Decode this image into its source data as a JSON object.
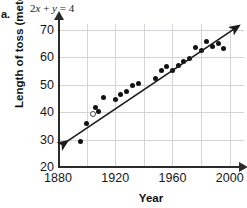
{
  "problem": {
    "letter": "a.",
    "equation": "2x + y = 4",
    "equation_lhs_coeff": "2",
    "equation_var_x": "x",
    "equation_plus": "+",
    "equation_var_y": "y",
    "equation_equals": "=",
    "equation_rhs": "4"
  },
  "chart_data": {
    "type": "scatter",
    "title": "",
    "xlabel": "Year",
    "ylabel": "Length of toss (meters)",
    "xlim": [
      1880,
      2010
    ],
    "ylim": [
      20,
      72
    ],
    "xticks": [
      1880,
      1920,
      1960,
      2000
    ],
    "xtick_labels": [
      "1880",
      "1920",
      "1960",
      "2000"
    ],
    "yticks": [
      20,
      30,
      40,
      50,
      60,
      70
    ],
    "ytick_labels": [
      "20",
      "30",
      "40",
      "50",
      "60",
      "70"
    ],
    "x_gridlines": [
      1900,
      1920,
      1940,
      1960,
      1980,
      2000
    ],
    "y_gridlines": [
      30,
      40,
      50,
      60,
      70
    ],
    "grid": true,
    "legend": "none",
    "series": [
      {
        "name": "Length of toss",
        "marker": "filled-circle",
        "points": [
          {
            "x": 1896,
            "y": 29.2,
            "style": "filled"
          },
          {
            "x": 1900,
            "y": 36.0,
            "style": "filled"
          },
          {
            "x": 1904,
            "y": 39.3,
            "style": "open"
          },
          {
            "x": 1906,
            "y": 41.5,
            "style": "filled"
          },
          {
            "x": 1908,
            "y": 40.2,
            "style": "filled"
          },
          {
            "x": 1912,
            "y": 45.2,
            "style": "filled"
          },
          {
            "x": 1920,
            "y": 44.7,
            "style": "filled"
          },
          {
            "x": 1924,
            "y": 46.2,
            "style": "filled"
          },
          {
            "x": 1928,
            "y": 47.3,
            "style": "filled"
          },
          {
            "x": 1932,
            "y": 49.5,
            "style": "filled"
          },
          {
            "x": 1936,
            "y": 50.5,
            "style": "filled"
          },
          {
            "x": 1948,
            "y": 52.1,
            "style": "filled"
          },
          {
            "x": 1952,
            "y": 55.0,
            "style": "filled"
          },
          {
            "x": 1956,
            "y": 56.4,
            "style": "filled"
          },
          {
            "x": 1960,
            "y": 55.1,
            "style": "filled"
          },
          {
            "x": 1964,
            "y": 57.0,
            "style": "filled"
          },
          {
            "x": 1968,
            "y": 58.2,
            "style": "filled"
          },
          {
            "x": 1972,
            "y": 59.4,
            "style": "filled"
          },
          {
            "x": 1976,
            "y": 63.5,
            "style": "filled"
          },
          {
            "x": 1980,
            "y": 62.4,
            "style": "filled"
          },
          {
            "x": 1984,
            "y": 65.5,
            "style": "filled"
          },
          {
            "x": 1988,
            "y": 63.9,
            "style": "filled"
          },
          {
            "x": 1992,
            "y": 65.0,
            "style": "filled"
          },
          {
            "x": 1996,
            "y": 63.2,
            "style": "filled"
          }
        ]
      }
    ],
    "trend_line": {
      "name": "line of best fit",
      "style": "double-headed-arrow",
      "x_start": 1884,
      "y_start": 28.5,
      "x_end": 2004,
      "y_end": 70.5
    }
  }
}
